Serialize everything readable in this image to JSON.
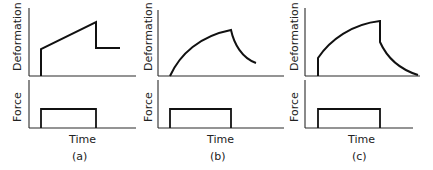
{
  "figure": {
    "panels": [
      {
        "id": "a",
        "caption": "(a)",
        "x_label": "Time",
        "top_y_label": "Deformation",
        "bottom_y_label": "Force",
        "description": "Instantaneous elastic jump, linear creep during loading, instantaneous partial recovery, permanent residual deformation"
      },
      {
        "id": "b",
        "caption": "(b)",
        "x_label": "Time",
        "top_y_label": "Deformation",
        "bottom_y_label": "Force",
        "description": "Delayed (viscoelastic) rise during loading, gradual decaying recovery after unloading"
      },
      {
        "id": "c",
        "caption": "(c)",
        "x_label": "Time",
        "top_y_label": "Deformation",
        "bottom_y_label": "Force",
        "description": "Instantaneous jump then delayed rise, instantaneous partial drop then gradual recovery to zero"
      }
    ],
    "colors": {
      "line": "#111111",
      "axis": "#2a2a2a",
      "text": "#222222",
      "background": "#ffffff"
    }
  }
}
